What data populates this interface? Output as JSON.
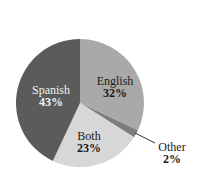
{
  "chart_data": {
    "type": "pie",
    "title": "",
    "start_angle_deg": 0,
    "direction": "clockwise",
    "slices": [
      {
        "label": "English",
        "value": 32,
        "display": "32%",
        "color": "#a9a9a9",
        "text_color": "#1a1a1a",
        "label_pos": [
          115,
          81
        ]
      },
      {
        "label": "Other",
        "value": 2,
        "display": "2%",
        "color": "#7d7d7d",
        "text_color": "#1a1a1a",
        "label_pos": [
          172,
          147
        ],
        "external": true,
        "leader": [
          [
            135,
            133
          ],
          [
            155,
            143
          ]
        ]
      },
      {
        "label": "Both",
        "value": 23,
        "display": "23%",
        "color": "#d7d7d7",
        "text_color": "#1a1a1a",
        "label_pos": [
          90,
          136
        ]
      },
      {
        "label": "Spanish",
        "value": 43,
        "display": "43%",
        "color": "#5b5b5b",
        "text_color": "#f2f2f2",
        "label_pos": [
          51,
          90
        ]
      }
    ],
    "categories": [
      "English",
      "Other",
      "Both",
      "Spanish"
    ],
    "values": [
      32,
      2,
      23,
      43
    ],
    "center": [
      80,
      103
    ],
    "radius": 64,
    "legend": "none"
  },
  "labels": {
    "english_name": "English",
    "english_pct": "32%",
    "other_name": "Other",
    "other_pct": "2%",
    "both_name": "Both",
    "both_pct": "23%",
    "spanish_name": "Spanish",
    "spanish_pct": "43%"
  }
}
